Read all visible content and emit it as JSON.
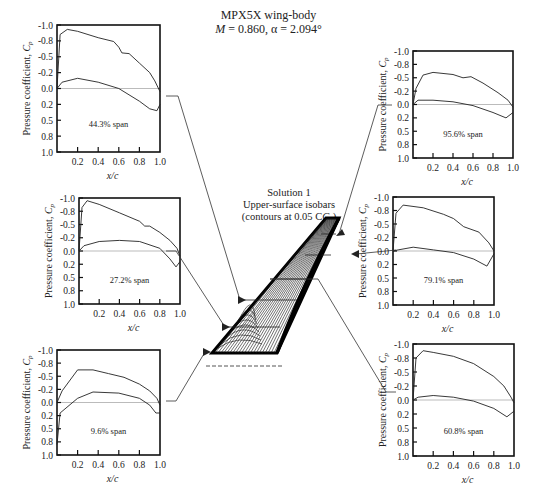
{
  "header": {
    "title": "MPX5X wing-body",
    "subtitle": "M = 0.860, α = 2.094°",
    "subtitle_parts": {
      "mach_symbol": "M",
      "mach_value": " = 0.860, α = 2.094°"
    }
  },
  "center_label": {
    "line1": "Solution 1",
    "line2": "Upper-surface isobars",
    "line3": "(contours at 0.05 C",
    "line3_sub": "p",
    "line3_end": ")"
  },
  "axis": {
    "ylabel": "Pressure coefficient, C",
    "ylabel_sub": "p",
    "xlabel": "x/c",
    "yticks": [
      "-1.0",
      "-0.8",
      "-0.5",
      "-0.2",
      "0.0",
      "0.2",
      "0.5",
      "0.8",
      "1.0"
    ],
    "xticks": [
      "0.2",
      "0.4",
      "0.6",
      "0.8",
      "1.0"
    ]
  },
  "colors": {
    "line": "#222222",
    "zero_line": "#aaaaaa",
    "frame": "#111111"
  },
  "chart_data": [
    {
      "type": "line",
      "title": "44.3% span",
      "xlabel": "x/c",
      "ylabel": "Pressure coefficient, Cp",
      "xlim": [
        0,
        1
      ],
      "ylim": [
        1.0,
        -1.0
      ],
      "series": [
        {
          "name": "upper surface",
          "x": [
            0.0,
            0.03,
            0.1,
            0.2,
            0.4,
            0.55,
            0.6,
            0.63,
            0.7,
            0.8,
            0.9,
            0.95,
            1.0
          ],
          "y": [
            0.0,
            -0.85,
            -0.93,
            -0.9,
            -0.8,
            -0.74,
            -0.65,
            -0.56,
            -0.55,
            -0.4,
            -0.25,
            -0.12,
            0.05
          ]
        },
        {
          "name": "lower surface",
          "x": [
            0.0,
            0.05,
            0.2,
            0.4,
            0.6,
            0.8,
            0.9,
            0.97,
            1.0
          ],
          "y": [
            0.0,
            -0.1,
            -0.16,
            -0.1,
            0.0,
            0.2,
            0.32,
            0.35,
            0.25
          ]
        }
      ]
    },
    {
      "type": "line",
      "title": "27.2% span",
      "xlabel": "x/c",
      "ylabel": "Pressure coefficient, Cp",
      "xlim": [
        0,
        1
      ],
      "ylim": [
        1.0,
        -1.0
      ],
      "series": [
        {
          "name": "upper surface",
          "x": [
            0.0,
            0.03,
            0.08,
            0.2,
            0.4,
            0.6,
            0.65,
            0.7,
            0.8,
            0.9,
            0.97,
            1.0
          ],
          "y": [
            0.0,
            -0.82,
            -0.95,
            -0.88,
            -0.72,
            -0.56,
            -0.47,
            -0.47,
            -0.35,
            -0.2,
            -0.05,
            0.1
          ]
        },
        {
          "name": "lower surface",
          "x": [
            0.0,
            0.05,
            0.2,
            0.4,
            0.6,
            0.8,
            0.9,
            0.96,
            1.0
          ],
          "y": [
            0.0,
            -0.1,
            -0.18,
            -0.2,
            -0.18,
            -0.05,
            0.15,
            0.3,
            0.2
          ]
        }
      ]
    },
    {
      "type": "line",
      "title": "9.6% span",
      "xlabel": "x/c",
      "ylabel": "Pressure coefficient, Cp",
      "xlim": [
        0,
        1
      ],
      "ylim": [
        1.0,
        -1.0
      ],
      "series": [
        {
          "name": "upper surface",
          "x": [
            0.0,
            0.05,
            0.2,
            0.35,
            0.5,
            0.65,
            0.8,
            0.9,
            0.97,
            1.0
          ],
          "y": [
            0.0,
            -0.22,
            -0.62,
            -0.62,
            -0.55,
            -0.48,
            -0.35,
            -0.22,
            -0.08,
            0.05
          ]
        },
        {
          "name": "lower surface",
          "x": [
            0.0,
            0.03,
            0.2,
            0.35,
            0.6,
            0.8,
            0.9,
            0.96,
            1.0
          ],
          "y": [
            0.8,
            0.2,
            -0.08,
            -0.2,
            -0.18,
            -0.08,
            0.05,
            0.2,
            0.2
          ]
        }
      ]
    },
    {
      "type": "line",
      "title": "95.6% span",
      "xlabel": "x/c",
      "ylabel": "Pressure coefficient, Cp",
      "xlim": [
        0,
        1
      ],
      "ylim": [
        1.0,
        -1.0
      ],
      "series": [
        {
          "name": "upper surface",
          "x": [
            0.0,
            0.03,
            0.1,
            0.2,
            0.4,
            0.5,
            0.58,
            0.7,
            0.85,
            0.95,
            1.0
          ],
          "y": [
            0.0,
            -0.3,
            -0.55,
            -0.6,
            -0.56,
            -0.5,
            -0.52,
            -0.4,
            -0.22,
            -0.08,
            0.05
          ]
        },
        {
          "name": "lower surface",
          "x": [
            0.0,
            0.05,
            0.2,
            0.4,
            0.6,
            0.8,
            0.93,
            1.0
          ],
          "y": [
            0.0,
            -0.08,
            -0.08,
            -0.05,
            0.02,
            0.15,
            0.25,
            0.15
          ]
        }
      ]
    },
    {
      "type": "line",
      "title": "79.1% span",
      "xlabel": "x/c",
      "ylabel": "Pressure coefficient, Cp",
      "xlim": [
        0,
        1
      ],
      "ylim": [
        1.0,
        -1.0
      ],
      "series": [
        {
          "name": "upper surface",
          "x": [
            0.0,
            0.03,
            0.1,
            0.3,
            0.5,
            0.6,
            0.7,
            0.85,
            0.95,
            1.0
          ],
          "y": [
            0.0,
            -0.7,
            -0.85,
            -0.8,
            -0.68,
            -0.6,
            -0.45,
            -0.35,
            -0.15,
            0.0
          ]
        },
        {
          "name": "lower surface",
          "x": [
            0.0,
            0.05,
            0.2,
            0.4,
            0.6,
            0.8,
            0.93,
            1.0
          ],
          "y": [
            0.0,
            -0.02,
            -0.07,
            -0.02,
            0.03,
            0.15,
            0.28,
            0.05
          ]
        }
      ]
    },
    {
      "type": "line",
      "title": "60.8% span",
      "xlabel": "x/c",
      "ylabel": "Pressure coefficient, Cp",
      "xlim": [
        0,
        1
      ],
      "ylim": [
        1.0,
        -1.0
      ],
      "series": [
        {
          "name": "upper surface",
          "x": [
            0.0,
            0.03,
            0.1,
            0.2,
            0.4,
            0.6,
            0.8,
            0.9,
            0.97,
            1.0
          ],
          "y": [
            0.0,
            -0.75,
            -0.88,
            -0.85,
            -0.78,
            -0.65,
            -0.42,
            -0.25,
            -0.05,
            0.05
          ]
        },
        {
          "name": "lower surface",
          "x": [
            0.0,
            0.05,
            0.2,
            0.4,
            0.6,
            0.8,
            0.93,
            1.0
          ],
          "y": [
            0.0,
            -0.05,
            -0.08,
            -0.05,
            0.02,
            0.15,
            0.3,
            0.2
          ]
        }
      ]
    }
  ],
  "plots": [
    {
      "label": "44.3% span"
    },
    {
      "label": "27.2% span"
    },
    {
      "label": "9.6% span"
    },
    {
      "label": "95.6% span"
    },
    {
      "label": "79.1% span"
    },
    {
      "label": "60.8% span"
    }
  ]
}
